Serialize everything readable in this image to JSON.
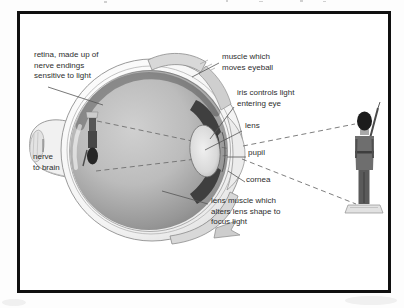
{
  "figure": {
    "title_hint": "cross-section diagram of the human eye seeing a toy soldier",
    "labels": {
      "retina": "retina, made up of\nnerve endings\nsensitive to light",
      "muscle": "muscle which\nmoves eyeball",
      "iris": "iris controls light\nentering eye",
      "lens": "lens",
      "pupil": "pupil",
      "cornea": "cornea",
      "lens_muscle": "lens muscle which\nalters lens shape to\nfocus light",
      "nerve": "nerve\nto brain"
    },
    "colors": {
      "frame_border": "#101010",
      "background": "#ffffff",
      "ink": "#2e2e2e",
      "ray_dash": "#6f6f6f",
      "eye_interior_light": "#cfcfcf",
      "eye_interior_dark": "#7d7d7d"
    }
  }
}
